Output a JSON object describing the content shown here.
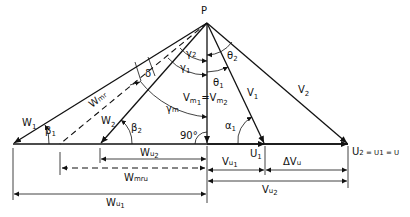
{
  "diagram": {
    "type": "velocity-triangle",
    "apex": "P",
    "vectors": {
      "w1": "W",
      "w1_sub": "1",
      "w2": "W",
      "w2_sub": "2",
      "wmr": "W",
      "wmr_sub": "mr",
      "v1": "V",
      "v1_sub": "1",
      "v2": "V",
      "v2_sub": "2",
      "vm": "V",
      "vm1_sub": "m",
      "vm1_sub2": "1",
      "vm_eq": "=",
      "vm2_sub2": "2"
    },
    "angles": {
      "beta1": "β",
      "beta1_sub": "1",
      "beta2": "β",
      "beta2_sub": "2",
      "delta": "δ",
      "gamma1": "γ",
      "gamma1_sub": "1",
      "gamma2": "γ",
      "gamma2_sub": "2",
      "gamma_m": "γ",
      "gamma_m_sub": "m",
      "theta1": "θ",
      "theta1_sub": "1",
      "theta2": "θ",
      "theta2_sub": "2",
      "alpha1": "α",
      "alpha1_sub": "1",
      "right_angle": "90°"
    },
    "dimensions": {
      "wu2": "W",
      "wu2_sub": "u",
      "wu2_sub2": "2",
      "wmru": "W",
      "wmru_sub": "mru",
      "wu1": "W",
      "wu1_sub": "u",
      "wu1_sub2": "1",
      "u1": "U",
      "u1_sub": "1",
      "vu1": "V",
      "vu1_sub": "u",
      "vu1_sub2": "1",
      "delta_vu": "ΔV",
      "delta_vu_sub": "u",
      "vu2": "V",
      "vu2_sub": "u",
      "vu2_sub2": "2",
      "u_eq": "U",
      "u_eq_text": "2 = U",
      "u_eq_text2": "1 = U"
    }
  }
}
